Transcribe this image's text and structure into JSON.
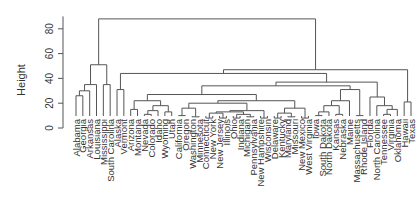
{
  "chart_data": {
    "type": "dendrogram",
    "title": "",
    "xlabel": "",
    "ylabel": "Height",
    "ylim": [
      0,
      90
    ],
    "yticks": [
      0,
      20,
      40,
      60,
      80
    ],
    "grid": false,
    "legend": null,
    "line_color": "#555555",
    "leaves": [
      "Alabama",
      "Georgia",
      "Arkansas",
      "Louisiana",
      "Mississippi",
      "South Carolina",
      "Alaska",
      "Vermont",
      "Arizona",
      "Montana",
      "Nevada",
      "Colorado",
      "Idaho",
      "Wyoming",
      "Utah",
      "California",
      "Oregon",
      "Washington",
      "Minnesota",
      "Connecticut",
      "New York",
      "New Jersey",
      "Illinois",
      "Ohio",
      "Indiana",
      "Michigan",
      "Pennsylvania",
      "New Hampshire",
      "Wisconsin",
      "Delaware",
      "Kentucky",
      "Maryland",
      "Missouri",
      "New Mexico",
      "West Virginia",
      "Iowa",
      "South Dakota",
      "North Dakota",
      "Kansas",
      "Nebraska",
      "Maine",
      "Massachusetts",
      "Rhode Island",
      "Florida",
      "North Carolina",
      "Tennessee",
      "Virginia",
      "Oklahoma",
      "Hawaii",
      "Texas"
    ],
    "merges": [
      {
        "id": "m1",
        "left": "Alabama",
        "right": "Georgia",
        "height": 26
      },
      {
        "id": "m2",
        "left": "m1",
        "right": "Arkansas",
        "height": 30
      },
      {
        "id": "m3",
        "left": "m2",
        "right": "Louisiana",
        "height": 35
      },
      {
        "id": "m4",
        "left": "Mississippi",
        "right": "South Carolina",
        "height": 35
      },
      {
        "id": "m5",
        "left": "m3",
        "right": "m4",
        "height": 51
      },
      {
        "id": "m6",
        "left": "Alaska",
        "right": "Vermont",
        "height": 31
      },
      {
        "id": "m7",
        "left": "Arizona",
        "right": "Montana",
        "height": 15
      },
      {
        "id": "m8",
        "left": "Nevada",
        "right": "Colorado",
        "height": 11
      },
      {
        "id": "m9",
        "left": "m8",
        "right": "Idaho",
        "height": 14
      },
      {
        "id": "m10",
        "left": "Wyoming",
        "right": "Utah",
        "height": 13
      },
      {
        "id": "m11",
        "left": "m9",
        "right": "m10",
        "height": 18
      },
      {
        "id": "m12",
        "left": "m7",
        "right": "m11",
        "height": 22
      },
      {
        "id": "m13",
        "left": "California",
        "right": "Oregon",
        "height": 10
      },
      {
        "id": "m14",
        "left": "Washington",
        "right": "Minnesota",
        "height": 9
      },
      {
        "id": "m15",
        "left": "m13",
        "right": "m14",
        "height": 16
      },
      {
        "id": "m16",
        "left": "Connecticut",
        "right": "New York",
        "height": 8
      },
      {
        "id": "m17",
        "left": "New Jersey",
        "right": "Illinois",
        "height": 8
      },
      {
        "id": "m18",
        "left": "m16",
        "right": "m17",
        "height": 12
      },
      {
        "id": "m19",
        "left": "Ohio",
        "right": "Indiana",
        "height": 8
      },
      {
        "id": "m20",
        "left": "Michigan",
        "right": "Pennsylvania",
        "height": 9
      },
      {
        "id": "m21",
        "left": "m19",
        "right": "m20",
        "height": 11
      },
      {
        "id": "m22",
        "left": "m18",
        "right": "m21",
        "height": 13
      },
      {
        "id": "m23",
        "left": "New Hampshire",
        "right": "Wisconsin",
        "height": 8
      },
      {
        "id": "m24",
        "left": "m22",
        "right": "m23",
        "height": 14
      },
      {
        "id": "m25",
        "left": "m15",
        "right": "m24",
        "height": 20
      },
      {
        "id": "m26",
        "left": "Delaware",
        "right": "Kentucky",
        "height": 8
      },
      {
        "id": "m27",
        "left": "Maryland",
        "right": "Missouri",
        "height": 9
      },
      {
        "id": "m28",
        "left": "m26",
        "right": "m27",
        "height": 12
      },
      {
        "id": "m29",
        "left": "New Mexico",
        "right": "West Virginia",
        "height": 8
      },
      {
        "id": "m30",
        "left": "m28",
        "right": "m29",
        "height": 16
      },
      {
        "id": "m31",
        "left": "m25",
        "right": "m30",
        "height": 22
      },
      {
        "id": "m32",
        "left": "m12",
        "right": "m31",
        "height": 27
      },
      {
        "id": "m33",
        "left": "Iowa",
        "right": "South Dakota",
        "height": 10
      },
      {
        "id": "m34",
        "left": "m33",
        "right": "North Dakota",
        "height": 13
      },
      {
        "id": "m35",
        "left": "Kansas",
        "right": "Nebraska",
        "height": 11
      },
      {
        "id": "m36",
        "left": "m34",
        "right": "m35",
        "height": 18
      },
      {
        "id": "m37",
        "left": "m36",
        "right": "Maine",
        "height": 22
      },
      {
        "id": "m38",
        "left": "Massachusetts",
        "right": "Rhode Island",
        "height": 10
      },
      {
        "id": "m39",
        "left": "m37",
        "right": "m38",
        "height": 31
      },
      {
        "id": "m40",
        "left": "m32",
        "right": "m39",
        "height": 34
      },
      {
        "id": "m41",
        "left": "Tennessee",
        "right": "Virginia",
        "height": 11
      },
      {
        "id": "m42",
        "left": "m41",
        "right": "Oklahoma",
        "height": 15
      },
      {
        "id": "m43",
        "left": "North Carolina",
        "right": "m42",
        "height": 18
      },
      {
        "id": "m44",
        "left": "Florida",
        "right": "m43",
        "height": 25
      },
      {
        "id": "m45",
        "left": "m40",
        "right": "m44",
        "height": 37
      },
      {
        "id": "m46",
        "left": "m6",
        "right": "m45",
        "height": 44
      },
      {
        "id": "m47",
        "left": "Hawaii",
        "right": "Texas",
        "height": 21
      },
      {
        "id": "m48",
        "left": "m46",
        "right": "m47",
        "height": 47
      },
      {
        "id": "m49",
        "left": "m5",
        "right": "m48",
        "height": 88
      }
    ]
  }
}
